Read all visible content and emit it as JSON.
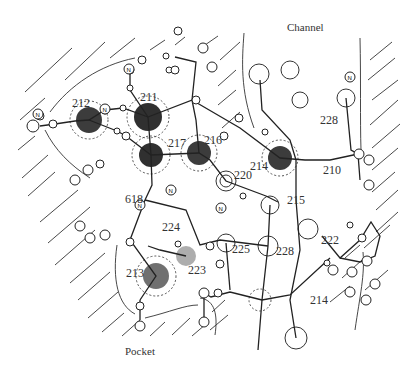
{
  "figure": {
    "regions": {
      "channel": "Channel",
      "pocket": "Pocket"
    },
    "residue_labels": [
      {
        "id": "212",
        "x": 75,
        "y": 99
      },
      {
        "id": "211",
        "x": 142,
        "y": 93
      },
      {
        "id": "217",
        "x": 170,
        "y": 142
      },
      {
        "id": "216",
        "x": 206,
        "y": 136
      },
      {
        "id": "220",
        "x": 236,
        "y": 170
      },
      {
        "id": "214",
        "x": 247,
        "y": 158
      },
      {
        "id": "228",
        "x": 321,
        "y": 120
      },
      {
        "id": "210",
        "x": 323,
        "y": 165
      },
      {
        "id": "215",
        "x": 295,
        "y": 196
      },
      {
        "id": "618",
        "x": 123,
        "y": 192
      },
      {
        "id": "224",
        "x": 162,
        "y": 224
      },
      {
        "id": "213",
        "x": 125,
        "y": 268
      },
      {
        "id": "223",
        "x": 191,
        "y": 268
      },
      {
        "id": "225",
        "x": 233,
        "y": 245
      },
      {
        "id": "228b",
        "text": "228",
        "x": 276,
        "y": 246
      },
      {
        "id": "222",
        "x": 322,
        "y": 235
      },
      {
        "id": "214b",
        "text": "214",
        "x": 308,
        "y": 297
      }
    ],
    "colors": {
      "ink": "#222222",
      "density_dark": "#1a1a1a",
      "background": "#ffffff"
    }
  }
}
